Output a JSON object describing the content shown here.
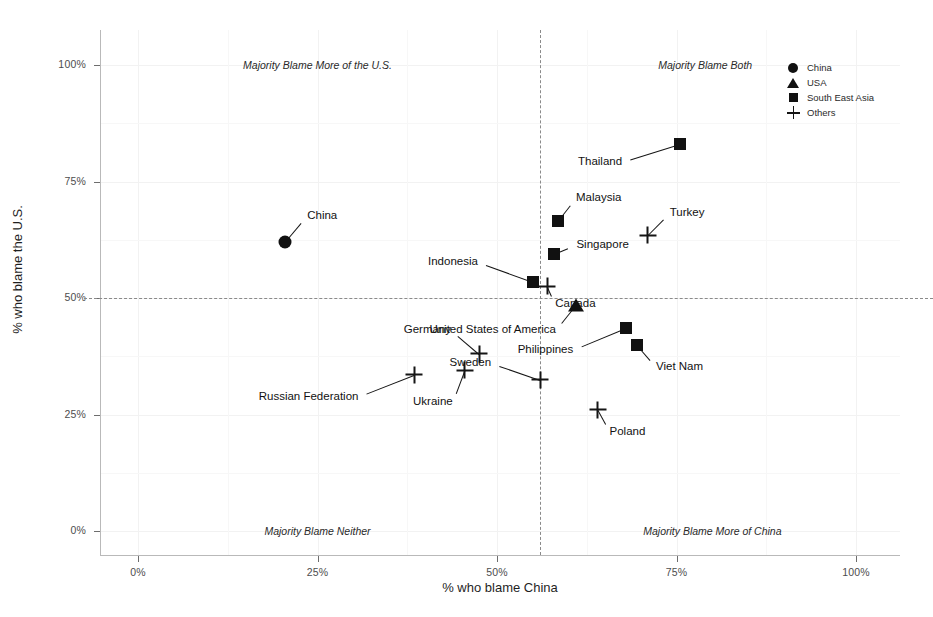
{
  "chart_data": {
    "type": "scatter",
    "title": "",
    "xlabel": "% who blame China",
    "ylabel": "% who blame the U.S.",
    "xlim": [
      -7,
      105
    ],
    "ylim": [
      -6,
      106
    ],
    "xticks": [
      "0%",
      "25%",
      "50%",
      "75%",
      "100%"
    ],
    "xtick_values": [
      0,
      25,
      50,
      75,
      100
    ],
    "yticks": [
      "0%",
      "25%",
      "50%",
      "75%",
      "100%"
    ],
    "ytick_values": [
      0,
      25,
      50,
      75,
      100
    ],
    "grid": true,
    "legend_position": "top-right",
    "reference_lines": {
      "vertical_x": 56,
      "horizontal_y": 50
    },
    "annotations": [
      {
        "text": "Majority Blame More of the U.S.",
        "x": 25,
        "y": 100
      },
      {
        "text": "Majority Blame Both",
        "x": 79,
        "y": 100
      },
      {
        "text": "Majority Blame Neither",
        "x": 25,
        "y": 0
      },
      {
        "text": "Majority Blame More of China",
        "x": 80,
        "y": 0
      }
    ],
    "series": [
      {
        "name": "China",
        "marker": "circle"
      },
      {
        "name": "USA",
        "marker": "triangle"
      },
      {
        "name": "South East Asia",
        "marker": "square"
      },
      {
        "name": "Others",
        "marker": "plus"
      }
    ],
    "points": [
      {
        "label": "China",
        "group": "China",
        "marker": "circle",
        "x": 20.5,
        "y": 62,
        "label_dx": 22,
        "label_dy": -26
      },
      {
        "label": "United States of America",
        "group": "USA",
        "marker": "triangle",
        "x": 61,
        "y": 48.5,
        "label_dx": -20,
        "label_dy": 25
      },
      {
        "label": "Thailand",
        "group": "South East Asia",
        "marker": "square",
        "x": 75.5,
        "y": 83,
        "label_dx": -58,
        "label_dy": 18
      },
      {
        "label": "Malaysia",
        "group": "South East Asia",
        "marker": "square",
        "x": 58.5,
        "y": 66.5,
        "label_dx": 18,
        "label_dy": -23
      },
      {
        "label": "Singapore",
        "group": "South East Asia",
        "marker": "square",
        "x": 58,
        "y": 59.5,
        "label_dx": 22,
        "label_dy": -9
      },
      {
        "label": "Indonesia",
        "group": "South East Asia",
        "marker": "square",
        "x": 55,
        "y": 53.5,
        "label_dx": -55,
        "label_dy": -20
      },
      {
        "label": "Philippines",
        "group": "South East Asia",
        "marker": "square",
        "x": 68,
        "y": 43.5,
        "label_dx": -53,
        "label_dy": 22
      },
      {
        "label": "Viet Nam",
        "group": "South East Asia",
        "marker": "square",
        "x": 69.5,
        "y": 40,
        "label_dx": 19,
        "label_dy": 22
      },
      {
        "label": "Canada",
        "group": "Others",
        "marker": "plus",
        "x": 57,
        "y": 52.5,
        "label_dx": 8,
        "label_dy": 18
      },
      {
        "label": "Turkey",
        "group": "Others",
        "marker": "plus",
        "x": 71,
        "y": 63.5,
        "label_dx": 22,
        "label_dy": -22
      },
      {
        "label": "Germany",
        "group": "Others",
        "marker": "plus",
        "x": 47.5,
        "y": 38,
        "label_dx": -28,
        "label_dy": -24
      },
      {
        "label": "Russian Federation",
        "group": "Others",
        "marker": "plus",
        "x": 38.5,
        "y": 33.5,
        "label_dx": -56,
        "label_dy": 22
      },
      {
        "label": "Ukraine",
        "group": "Others",
        "marker": "plus",
        "x": 45.5,
        "y": 34.5,
        "label_dx": -12,
        "label_dy": 32
      },
      {
        "label": "Sweden",
        "group": "Others",
        "marker": "plus",
        "x": 56,
        "y": 32.5,
        "label_dx": -49,
        "label_dy": -17
      },
      {
        "label": "Poland",
        "group": "Others",
        "marker": "plus",
        "x": 64,
        "y": 26,
        "label_dx": 12,
        "label_dy": 22
      }
    ]
  },
  "legend": {
    "items": [
      {
        "label": "China",
        "marker": "circle"
      },
      {
        "label": "USA",
        "marker": "triangle"
      },
      {
        "label": "South East Asia",
        "marker": "square"
      },
      {
        "label": "Others",
        "marker": "plus"
      }
    ]
  },
  "colors": {
    "marker": "#111111",
    "axis": "#b9b9b9",
    "grid": "#f2f2f2",
    "reference_line": "#8a8a8a",
    "text": "#1a1a1a",
    "background": "#ffffff"
  }
}
